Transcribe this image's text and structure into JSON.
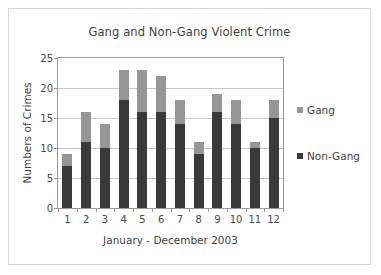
{
  "chart_data": {
    "type": "bar",
    "stacked": true,
    "title": "Gang and Non-Gang Violent Crime",
    "xlabel": "January - December 2003",
    "ylabel": "Numbers of Crimes",
    "categories": [
      "1",
      "2",
      "3",
      "4",
      "5",
      "6",
      "7",
      "8",
      "9",
      "10",
      "11",
      "12"
    ],
    "series": [
      {
        "name": "Non-Gang",
        "color": "#3a3a3a",
        "values": [
          7,
          11,
          10,
          18,
          16,
          16,
          14,
          9,
          16,
          14,
          10,
          15
        ]
      },
      {
        "name": "Gang",
        "color": "#969696",
        "values": [
          2,
          5,
          4,
          5,
          7,
          6,
          4,
          2,
          3,
          4,
          1,
          3
        ]
      }
    ],
    "totals": [
      9,
      16,
      14,
      23,
      23,
      22,
      18,
      11,
      19,
      18,
      11,
      18
    ],
    "ylim": [
      0,
      25
    ],
    "yticks": [
      0,
      5,
      10,
      15,
      20,
      25
    ],
    "ytick_labels": [
      "0",
      "5",
      "10",
      "15",
      "20",
      "25"
    ],
    "grid": true,
    "legend_position": "right",
    "legend": [
      {
        "label": "Gang",
        "color": "#969696"
      },
      {
        "label": "Non-Gang",
        "color": "#3a3a3a"
      }
    ]
  }
}
